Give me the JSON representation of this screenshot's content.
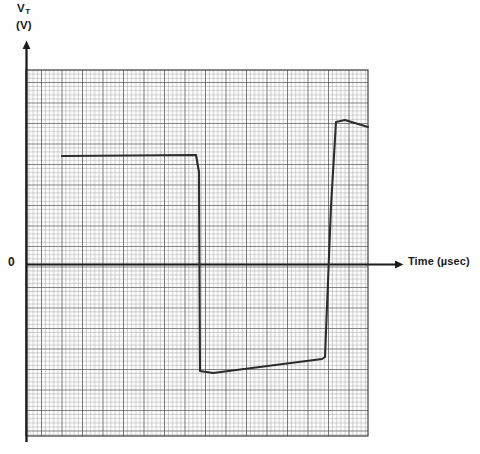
{
  "figure": {
    "y_axis": {
      "symbol": "V",
      "subscript": "T",
      "unit": "(V)",
      "origin_label": "0"
    },
    "x_axis": {
      "label": "Time (µsec)"
    },
    "colors": {
      "ink": "#1a1a1a",
      "grid_minor": "#9a9a9a",
      "grid_major": "#4a4a4a",
      "trace": "#2b2b2b",
      "background": "#ffffff"
    }
  },
  "chart_data": {
    "type": "line",
    "title": "",
    "xlabel": "Time (µsec)",
    "ylabel": "V_T (V)",
    "grid": true,
    "legend": "none",
    "axis_origin_label": "0",
    "plot_area": {
      "x_left_px": 26,
      "x_right_px": 368,
      "y_top_px": 70,
      "y_bottom_px": 436,
      "zero_line_px": 264,
      "minor_grid_px": 4.1,
      "major_grid_px": 20.5
    },
    "series": [
      {
        "name": "V_T",
        "description": "Transmission line terminal voltage: positive plateau, step down to negative plateau, step up to higher positive plateau",
        "points": [
          {
            "x_px": 62,
            "y_px": 156
          },
          {
            "x_px": 196,
            "y_px": 155
          },
          {
            "x_px": 199,
            "y_px": 172
          },
          {
            "x_px": 200,
            "y_px": 371
          },
          {
            "x_px": 213,
            "y_px": 373
          },
          {
            "x_px": 322,
            "y_px": 359
          },
          {
            "x_px": 325,
            "y_px": 357
          },
          {
            "x_px": 331,
            "y_px": 206
          },
          {
            "x_px": 336,
            "y_px": 122
          },
          {
            "x_px": 345,
            "y_px": 120
          },
          {
            "x_px": 368,
            "y_px": 127
          }
        ]
      }
    ],
    "levels": {
      "first_plateau_volts_relative": 0.53,
      "second_plateau_volts_relative": -0.52,
      "third_plateau_volts_relative": 0.7
    },
    "annotations": []
  }
}
